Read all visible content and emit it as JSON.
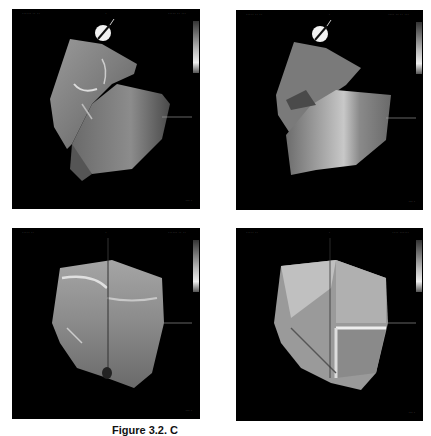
{
  "figure": {
    "caption": "Figure 3.2. C",
    "panels": [
      {
        "id": "top-left",
        "header_left": "······ ·· ··",
        "header_center": "·",
        "header_right": "····· ·· ···",
        "scale": "··· ·",
        "has_catheter_icon": true
      },
      {
        "id": "top-right",
        "header_left": "····· ·· ··",
        "header_center": "·",
        "header_right": "···· ·· ·· ···",
        "scale": "··· ·",
        "has_catheter_icon": true
      },
      {
        "id": "bottom-left",
        "header_left": "····· ··",
        "header_center": "·",
        "header_right": "······ ·· ··",
        "scale": "··· ·",
        "has_catheter_icon": false
      },
      {
        "id": "bottom-right",
        "header_left": "····· ··",
        "header_center": "·",
        "header_right": "···· ······",
        "scale": "··· ·",
        "has_catheter_icon": false
      }
    ],
    "colors": {
      "background": "#000000",
      "mesh_base": "#8a8a8a",
      "highlight": "#e6e6e6"
    }
  }
}
